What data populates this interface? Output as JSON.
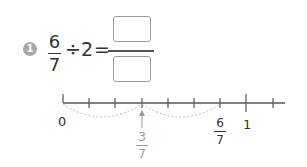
{
  "problem": {
    "number": "1",
    "expression": {
      "fraction": {
        "numerator": "6",
        "denominator": "7"
      },
      "operator": "÷",
      "divisor": "2",
      "equals": "=",
      "answer": {
        "numerator": "",
        "denominator": ""
      }
    }
  },
  "number_line": {
    "start_label": "0",
    "end_label": "1",
    "divisions": 7,
    "marked": {
      "numerator": "6",
      "denominator": "7"
    },
    "result": {
      "numerator": "3",
      "denominator": "7"
    },
    "colors": {
      "line": "#555555",
      "arc": "#bbbbbb",
      "result": "#9a9a9a"
    }
  }
}
